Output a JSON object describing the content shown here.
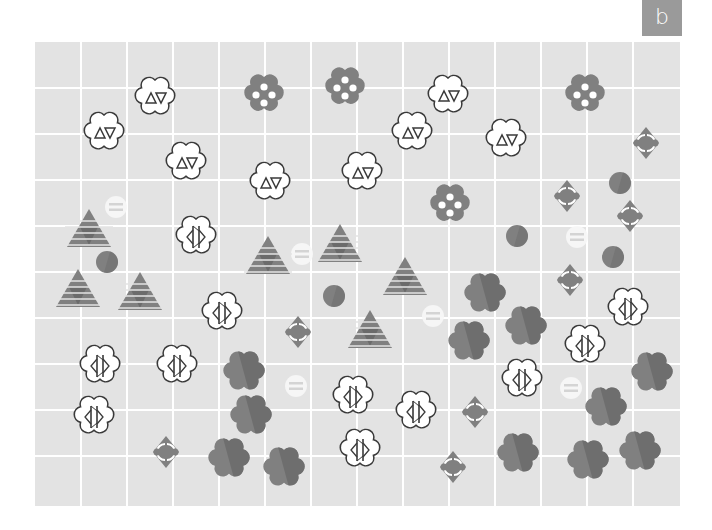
{
  "panel": {
    "label": "b"
  },
  "colors": {
    "background": "#e3e3e3",
    "grid_line": "#ffffff",
    "shape_dark": "#6b6b6b",
    "shape_light": "#808080",
    "outline": "#3a3a3a",
    "label_bg": "#9a9a9a"
  },
  "grid": {
    "x0": 35,
    "y0": 42,
    "x1": 680,
    "y1": 506,
    "cols": [
      35,
      81,
      127,
      173,
      219,
      265,
      311,
      357,
      403,
      449,
      495,
      541,
      587,
      633,
      680
    ],
    "rows": [
      42,
      88,
      134,
      180,
      226,
      272,
      318,
      364,
      410,
      456,
      506
    ]
  },
  "objects": {
    "triangle_flowers": [
      [
        155,
        98
      ],
      [
        104,
        133
      ],
      [
        186,
        163
      ],
      [
        270,
        183
      ],
      [
        362,
        173
      ],
      [
        448,
        96
      ],
      [
        412,
        133
      ],
      [
        506,
        140
      ]
    ],
    "dotted_flowers": [
      [
        264,
        95
      ],
      [
        345,
        88
      ],
      [
        585,
        95
      ],
      [
        450,
        205
      ]
    ],
    "gray_flowers": [
      [
        485,
        295
      ],
      [
        526,
        328
      ],
      [
        469,
        343
      ],
      [
        244,
        373
      ],
      [
        251,
        417
      ],
      [
        229,
        460
      ],
      [
        284,
        469
      ],
      [
        518,
        455
      ],
      [
        588,
        462
      ],
      [
        640,
        453
      ],
      [
        652,
        374
      ],
      [
        606,
        409
      ]
    ],
    "arc_diamonds": [
      [
        646,
        143
      ],
      [
        567,
        196
      ],
      [
        630,
        216
      ],
      [
        570,
        280
      ],
      [
        298,
        332
      ],
      [
        475,
        412
      ],
      [
        453,
        467
      ],
      [
        166,
        452
      ]
    ],
    "solid_circles": [
      [
        620,
        183
      ],
      [
        517,
        236
      ],
      [
        613,
        257
      ],
      [
        107,
        262
      ],
      [
        334,
        296
      ]
    ],
    "striped_circles": [
      [
        116,
        207
      ],
      [
        302,
        254
      ],
      [
        577,
        237
      ],
      [
        433,
        316
      ],
      [
        296,
        386
      ],
      [
        571,
        388
      ]
    ],
    "striped_triangles": [
      [
        89,
        229
      ],
      [
        268,
        256
      ],
      [
        340,
        244
      ],
      [
        405,
        277
      ],
      [
        78,
        289
      ],
      [
        140,
        292
      ],
      [
        370,
        330
      ]
    ],
    "slash_flowers": [
      [
        196,
        237
      ],
      [
        222,
        313
      ],
      [
        628,
        309
      ],
      [
        585,
        346
      ],
      [
        100,
        366
      ],
      [
        177,
        366
      ],
      [
        522,
        380
      ],
      [
        353,
        397
      ],
      [
        416,
        412
      ],
      [
        94,
        417
      ],
      [
        360,
        450
      ]
    ]
  }
}
